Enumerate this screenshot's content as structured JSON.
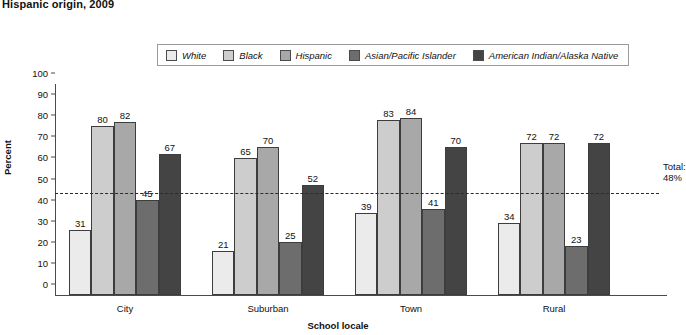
{
  "title": "Hispanic origin, 2009",
  "legend": {
    "items": [
      {
        "label": "White",
        "color": "#ebebeb"
      },
      {
        "label": "Black",
        "color": "#cdcdcd"
      },
      {
        "label": "Hispanic",
        "color": "#a8a8a8"
      },
      {
        "label": "Asian/Pacific Islander",
        "color": "#6d6d6d"
      },
      {
        "label": "American Indian/Alaska Native",
        "color": "#444444"
      }
    ]
  },
  "annotations": {
    "total_line_label_line1": "Total:",
    "total_line_label_line2": "48%"
  },
  "chart_data": {
    "type": "bar",
    "title": "Hispanic origin, 2009",
    "xlabel": "School locale",
    "ylabel": "Percent",
    "ylim": [
      0,
      100
    ],
    "yticks": [
      0,
      10,
      20,
      30,
      40,
      50,
      60,
      70,
      80,
      90,
      100
    ],
    "grid": false,
    "legend_position": "top-center",
    "categories": [
      "City",
      "Suburban",
      "Town",
      "Rural"
    ],
    "series": [
      {
        "name": "White",
        "color": "#ebebeb",
        "values": [
          31,
          21,
          39,
          34
        ]
      },
      {
        "name": "Black",
        "color": "#cdcdcd",
        "values": [
          80,
          65,
          83,
          72
        ]
      },
      {
        "name": "Hispanic",
        "color": "#a8a8a8",
        "values": [
          82,
          70,
          84,
          72
        ]
      },
      {
        "name": "Asian/Pacific Islander",
        "color": "#6d6d6d",
        "values": [
          45,
          25,
          41,
          23
        ]
      },
      {
        "name": "American Indian/Alaska Native",
        "color": "#444444",
        "values": [
          67,
          52,
          70,
          72
        ]
      }
    ],
    "reference_line": {
      "value": 48,
      "label": "Total: 48%",
      "style": "dashed"
    }
  }
}
